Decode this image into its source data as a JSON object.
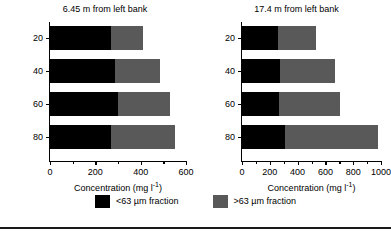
{
  "chart_data": {
    "type": "bar",
    "orientation": "horizontal",
    "stacked": true,
    "title": "",
    "ylabel": "Depth (%)",
    "xlabel": "Concentration (mg l⁻¹)",
    "categories": [
      "20",
      "40",
      "60",
      "80"
    ],
    "grid": false,
    "legend_position": "bottom",
    "legend": [
      {
        "name": "<63 µm fraction",
        "color": "#000000"
      },
      {
        "name": ">63 µm fraction",
        "color": "#595959"
      }
    ],
    "panels": [
      {
        "title": "6.45 m from left bank",
        "xlim": [
          0,
          600
        ],
        "xticks": [
          0,
          200,
          400,
          600
        ],
        "xticklabels": [
          "0",
          "200",
          "400",
          "600"
        ],
        "xminorticks": [
          100,
          300,
          500
        ],
        "yticklabels": [
          "20",
          "40",
          "60",
          "80"
        ],
        "series": [
          {
            "name": "<63 µm fraction",
            "color": "#000000",
            "values": [
              270,
              285,
              300,
              270
            ]
          },
          {
            "name": ">63 µm fraction",
            "color": "#595959",
            "values": [
              140,
              200,
              230,
              280
            ]
          }
        ],
        "totals": [
          410,
          485,
          530,
          550
        ]
      },
      {
        "title": "17.4 m from left bank",
        "xlim": [
          0,
          1000
        ],
        "xticks": [
          0,
          200,
          400,
          600,
          800,
          1000
        ],
        "xticklabels": [
          "0",
          "200",
          "400",
          "600",
          "800",
          "1000"
        ],
        "xminorticks": [
          100,
          300,
          500,
          700,
          900
        ],
        "yticklabels": [
          "20",
          "40",
          "60",
          "80"
        ],
        "series": [
          {
            "name": "<63 µm fraction",
            "color": "#000000",
            "values": [
              260,
              270,
              265,
              310
            ]
          },
          {
            "name": ">63 µm fraction",
            "color": "#595959",
            "values": [
              275,
              400,
              440,
              665
            ]
          }
        ],
        "totals": [
          535,
          670,
          705,
          975
        ]
      }
    ]
  },
  "axis": {
    "xlabel_main": "Concentration (mg l",
    "xlabel_sup": "-1",
    "xlabel_tail": ")",
    "ylabel": "Depth (%)"
  },
  "legend": {
    "fine_label": "<63 µm fraction",
    "coarse_label": ">63 µm fraction"
  },
  "panel_left": {
    "title": "6.45 m from left bank",
    "xticks": [
      "0",
      "200",
      "400",
      "600"
    ],
    "yticks": [
      "20",
      "40",
      "60",
      "80"
    ]
  },
  "panel_right": {
    "title": "17.4 m from left bank",
    "xticks": [
      "0",
      "200",
      "400",
      "600",
      "800",
      "1000"
    ],
    "yticks": [
      "20",
      "40",
      "60",
      "80"
    ]
  },
  "colors": {
    "fine": "#000000",
    "coarse": "#595959",
    "axis": "#000000",
    "background": "#ffffff"
  }
}
